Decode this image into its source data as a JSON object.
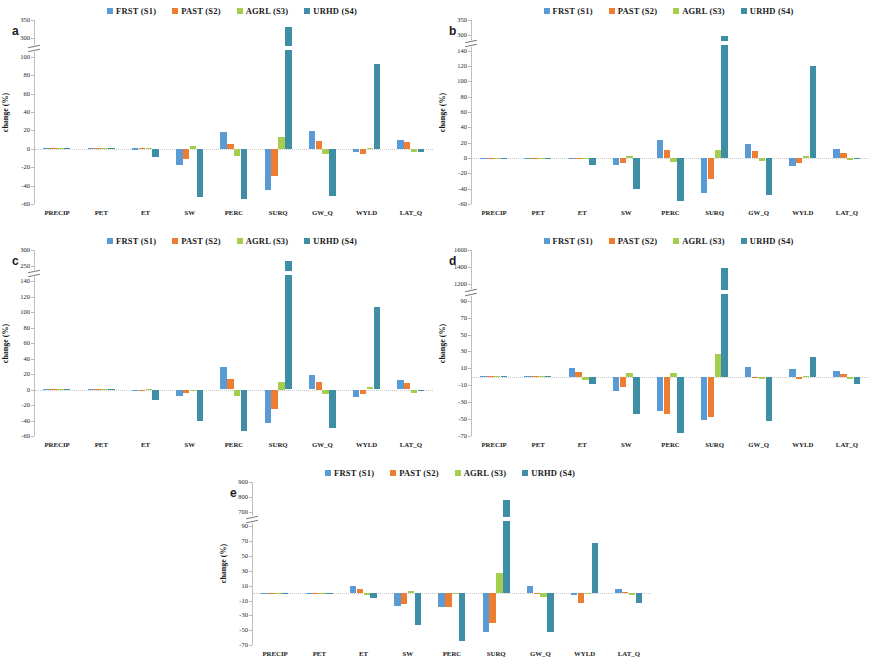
{
  "figure": {
    "series_colors": {
      "FRST": "#5B9BD5",
      "PAST": "#ED7D31",
      "AGRL": "#A5CE4E",
      "URHD": "#3E8EA6"
    },
    "legend": [
      {
        "label": "FRST (S1)",
        "key": "FRST"
      },
      {
        "label": "PAST (S2)",
        "key": "PAST"
      },
      {
        "label": "AGRL (S3)",
        "key": "AGRL"
      },
      {
        "label": "URHD (S4)",
        "key": "URHD"
      }
    ],
    "ylabel": "change (%)",
    "categories": [
      "PRECIP",
      "PET",
      "ET",
      "SW",
      "PERC",
      "SURQ",
      "GW_Q",
      "WYLD",
      "LAT_Q"
    ]
  },
  "panels": {
    "a": {
      "letter": "a"
    },
    "b": {
      "letter": "b"
    },
    "c": {
      "letter": "c"
    },
    "d": {
      "letter": "d"
    },
    "e": {
      "letter": "e"
    }
  },
  "chart_data": [
    {
      "id": "a",
      "type": "bar",
      "title": "a",
      "xlabel": "",
      "ylabel": "change (%)",
      "legend_position": "top-center",
      "grid": false,
      "axis_break": {
        "below": 100,
        "above": 300
      },
      "ticks": [
        350,
        300,
        100,
        80,
        60,
        40,
        20,
        0,
        -20,
        -40,
        -60
      ],
      "ylim": [
        -60,
        350
      ],
      "categories": [
        "PRECIP",
        "PET",
        "ET",
        "SW",
        "PERC",
        "SURQ",
        "GW_Q",
        "WYLD",
        "LAT_Q"
      ],
      "series": [
        {
          "name": "FRST (S1)",
          "values": [
            0,
            0,
            0.5,
            -18,
            18,
            -45,
            19,
            -4,
            10
          ]
        },
        {
          "name": "PAST (S2)",
          "values": [
            0,
            0,
            0.8,
            -11,
            5,
            -30,
            8,
            -6,
            7
          ]
        },
        {
          "name": "AGRL (S3)",
          "values": [
            0,
            0,
            0,
            3,
            -8,
            13,
            -6,
            1,
            -4
          ]
        },
        {
          "name": "URHD (S4)",
          "values": [
            0,
            0,
            -9,
            -52,
            -55,
            330,
            -51,
            92,
            -4
          ]
        }
      ]
    },
    {
      "id": "b",
      "type": "bar",
      "title": "b",
      "xlabel": "",
      "ylabel": "change (%)",
      "legend_position": "top-center",
      "grid": false,
      "axis_break": {
        "below": 140,
        "above": 300
      },
      "ticks": [
        350,
        300,
        140,
        120,
        100,
        80,
        60,
        40,
        20,
        0,
        -20,
        -40,
        -60
      ],
      "ylim": [
        -60,
        350
      ],
      "categories": [
        "PRECIP",
        "PET",
        "ET",
        "SW",
        "PERC",
        "SURQ",
        "GW_Q",
        "WYLD",
        "LAT_Q"
      ],
      "series": [
        {
          "name": "FRST (S1)",
          "values": [
            0.5,
            0.5,
            0.5,
            -9,
            23,
            -45,
            18,
            -11,
            12
          ]
        },
        {
          "name": "PAST (S2)",
          "values": [
            0.3,
            0.3,
            0.5,
            -6,
            11,
            -28,
            9,
            -6,
            7
          ]
        },
        {
          "name": "AGRL (S3)",
          "values": [
            0,
            0,
            0,
            2,
            -5,
            10,
            -4,
            2,
            -3
          ]
        },
        {
          "name": "URHD (S4)",
          "values": [
            0,
            0,
            -9,
            -41,
            -56,
            290,
            -48,
            120,
            -1
          ]
        }
      ]
    },
    {
      "id": "c",
      "type": "bar",
      "title": "c",
      "xlabel": "",
      "ylabel": "change (%)",
      "legend_position": "top-center",
      "grid": false,
      "axis_break": {
        "below": 140,
        "above": 250
      },
      "ticks": [
        300,
        250,
        140,
        120,
        100,
        80,
        60,
        40,
        20,
        0,
        -20,
        -40,
        -60
      ],
      "ylim": [
        -60,
        300
      ],
      "categories": [
        "PRECIP",
        "PET",
        "ET",
        "SW",
        "PERC",
        "SURQ",
        "GW_Q",
        "WYLD",
        "LAT_Q"
      ],
      "series": [
        {
          "name": "FRST (S1)",
          "values": [
            0.4,
            0.4,
            -2,
            -8,
            29,
            -43,
            19,
            -10,
            12
          ]
        },
        {
          "name": "PAST (S2)",
          "values": [
            0.3,
            0.3,
            -1,
            -5,
            14,
            -25,
            10,
            -6,
            8
          ]
        },
        {
          "name": "AGRL (S3)",
          "values": [
            0,
            0,
            0,
            -1,
            -8,
            10,
            -6,
            3,
            -5
          ]
        },
        {
          "name": "URHD (S4)",
          "values": [
            0,
            0,
            -13,
            -40,
            -53,
            265,
            -50,
            106,
            -1
          ]
        }
      ]
    },
    {
      "id": "d",
      "type": "bar",
      "title": "d",
      "xlabel": "",
      "ylabel": "change (%)",
      "legend_position": "top-center",
      "grid": false,
      "axis_break": {
        "below": 90,
        "above": 1200
      },
      "ticks": [
        1600,
        1400,
        1200,
        90,
        70,
        50,
        30,
        10,
        -10,
        -30,
        -50,
        -70
      ],
      "ylim": [
        -70,
        1600
      ],
      "categories": [
        "PRECIP",
        "PET",
        "ET",
        "SW",
        "PERC",
        "SURQ",
        "GW_Q",
        "WYLD",
        "LAT_Q"
      ],
      "series": [
        {
          "name": "FRST (S1)",
          "values": [
            0,
            0,
            11,
            -17,
            -40,
            -51,
            12,
            9,
            7
          ]
        },
        {
          "name": "PAST (S2)",
          "values": [
            0,
            0,
            6,
            -12,
            -44,
            -48,
            -1,
            -2,
            3
          ]
        },
        {
          "name": "AGRL (S3)",
          "values": [
            0,
            0,
            -4,
            4,
            5,
            27,
            -2,
            0,
            -3
          ]
        },
        {
          "name": "URHD (S4)",
          "values": [
            0,
            0,
            -8,
            -44,
            -67,
            1390,
            -52,
            23,
            -9
          ]
        }
      ]
    },
    {
      "id": "e",
      "type": "bar",
      "title": "e",
      "xlabel": "",
      "ylabel": "change (%)",
      "legend_position": "top-center",
      "grid": false,
      "axis_break": {
        "below": 90,
        "above": 700
      },
      "ticks": [
        900,
        800,
        700,
        90,
        70,
        50,
        30,
        10,
        -10,
        -30,
        -50,
        -70
      ],
      "ylim": [
        -70,
        900
      ],
      "categories": [
        "PRECIP",
        "PET",
        "ET",
        "SW",
        "PERC",
        "SURQ",
        "GW_Q",
        "WYLD",
        "LAT_Q"
      ],
      "series": [
        {
          "name": "FRST (S1)",
          "values": [
            0,
            0,
            10,
            -17,
            -19,
            -52,
            9,
            -2,
            6
          ]
        },
        {
          "name": "PAST (S2)",
          "values": [
            0,
            0,
            5,
            -15,
            -19,
            -40,
            -1,
            -13,
            2
          ]
        },
        {
          "name": "AGRL (S3)",
          "values": [
            0,
            0,
            -2,
            3,
            -1,
            27,
            -5,
            0,
            -3
          ]
        },
        {
          "name": "URHD (S4)",
          "values": [
            0,
            0,
            -7,
            -43,
            -65,
            780,
            -52,
            68,
            -13
          ]
        }
      ]
    }
  ]
}
